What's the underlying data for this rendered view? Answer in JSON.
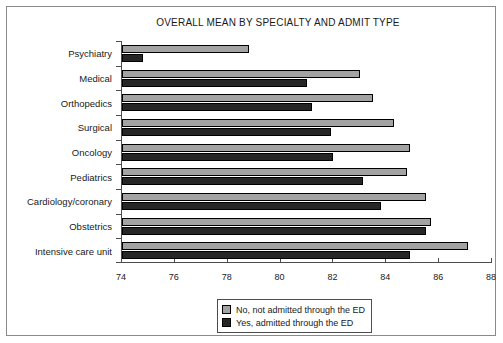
{
  "chart_data": {
    "type": "bar",
    "orientation": "horizontal",
    "title": "OVERALL MEAN BY SPECIALTY AND ADMIT TYPE",
    "xlabel": "",
    "ylabel": "",
    "xlim": [
      74,
      88
    ],
    "xticks": [
      74,
      76,
      78,
      80,
      82,
      84,
      86,
      88
    ],
    "grid": false,
    "legend_position": "bottom-center",
    "categories": [
      "Psychiatry",
      "Medical",
      "Orthopedics",
      "Surgical",
      "Oncology",
      "Pediatrics",
      "Cardiology/coronary",
      "Obstetrics",
      "Intensive care unit"
    ],
    "series": [
      {
        "name": "No, not admitted through the ED",
        "color": "#a3a3a3",
        "values": [
          78.8,
          83.0,
          83.5,
          84.3,
          84.9,
          84.8,
          85.5,
          85.7,
          87.1
        ]
      },
      {
        "name": "Yes, admitted through the ED",
        "color": "#262626",
        "values": [
          74.8,
          81.0,
          81.2,
          81.9,
          82.0,
          83.1,
          83.8,
          85.5,
          84.9
        ]
      }
    ]
  },
  "legend": {
    "items": [
      {
        "label": "No, not admitted through the ED"
      },
      {
        "label": "Yes, admitted through the ED"
      }
    ]
  }
}
